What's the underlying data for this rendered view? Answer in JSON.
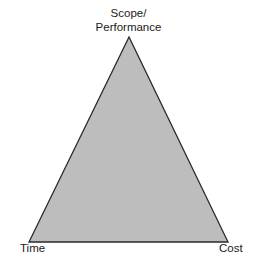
{
  "diagram": {
    "type": "triple-constraint-triangle",
    "vertices": {
      "top": {
        "line1": "Scope/",
        "line2": "Performance"
      },
      "bottom_left": "Time",
      "bottom_right": "Cost"
    },
    "colors": {
      "fill": "#bdbdbd",
      "stroke": "#2a2a2a",
      "text": "#1a1a1a"
    }
  }
}
